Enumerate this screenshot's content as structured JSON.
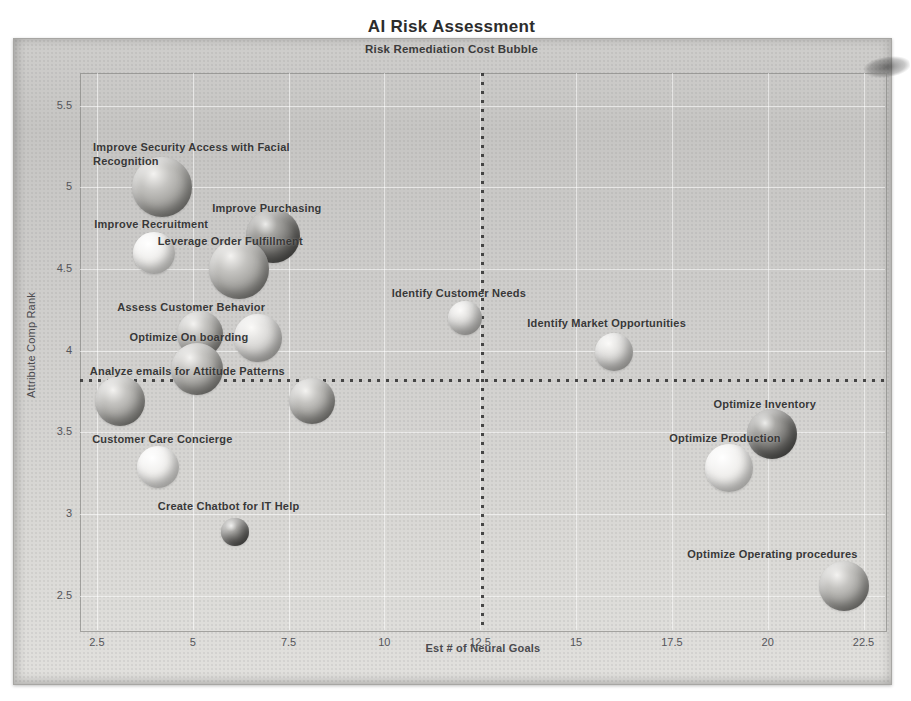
{
  "header": {
    "title": "AI Risk Assessment",
    "subtitle": "Risk Remediation Cost Bubble"
  },
  "chart_data": {
    "type": "scatter",
    "variant": "bubble",
    "title": "AI Risk Assessment",
    "subtitle": "Risk Remediation Cost Bubble",
    "xlabel": "Est # of Neural Goals",
    "ylabel": "Attribute Comp Rank",
    "xlim": [
      2.06,
      23.06
    ],
    "ylim": [
      2.29,
      5.7
    ],
    "x_ticks": [
      2.5,
      5,
      7.5,
      10,
      12.5,
      15,
      17.5,
      20,
      22.5
    ],
    "y_ticks": [
      5.5,
      5,
      4.5,
      4,
      3.5,
      3,
      2.5
    ],
    "grid": true,
    "legend": false,
    "reference_lines": {
      "vertical_x": 12.55,
      "horizontal_y": 3.82
    },
    "points": [
      {
        "label": "Improve Security Access with Facial Recognition",
        "x": 4.2,
        "y": 5.0,
        "r": 30,
        "shade": "medium",
        "label_dx": -69,
        "label_dy": -47,
        "label_width": 220
      },
      {
        "label": "Improve Recruitment",
        "x": 4.0,
        "y": 4.6,
        "r": 21,
        "shade": "xlight",
        "label_dx": -60,
        "label_dy": -35
      },
      {
        "label": "Improve Purchasing",
        "x": 7.1,
        "y": 4.7,
        "r": 27,
        "shade": "dark",
        "label_dx": -61,
        "label_dy": -34
      },
      {
        "label": "Leverage Order Fulfillment",
        "x": 6.2,
        "y": 4.5,
        "r": 30,
        "shade": "medium",
        "label_dx": -81,
        "label_dy": -34
      },
      {
        "label": "Assess Customer Behavior",
        "x": 5.2,
        "y": 4.1,
        "r": 23,
        "shade": "medium",
        "label_dx": -83,
        "label_dy": -33
      },
      {
        "label": "",
        "x": 6.7,
        "y": 4.08,
        "r": 24,
        "shade": "light"
      },
      {
        "label": "Optimize On boarding",
        "x": 5.1,
        "y": 3.89,
        "r": 26,
        "shade": "medium",
        "label_dx": -67,
        "label_dy": -38
      },
      {
        "label": "Analyze emails for Attitude Patterns",
        "x": 3.1,
        "y": 3.69,
        "r": 25,
        "shade": "medium",
        "label_dx": -30,
        "label_dy": -36
      },
      {
        "label": "",
        "x": 8.1,
        "y": 3.69,
        "r": 23,
        "shade": "medium"
      },
      {
        "label": "Identify Customer Needs",
        "x": 12.1,
        "y": 4.2,
        "r": 17,
        "shade": "light",
        "label_dx": -73,
        "label_dy": -31
      },
      {
        "label": "Identify Market Opportunities",
        "x": 16.0,
        "y": 3.99,
        "r": 19,
        "shade": "light",
        "label_dx": -87,
        "label_dy": -35
      },
      {
        "label": "Customer Care Concierge",
        "x": 4.1,
        "y": 3.29,
        "r": 21,
        "shade": "xlight",
        "label_dx": -66,
        "label_dy": -34
      },
      {
        "label": "Create Chatbot for IT Help",
        "x": 6.1,
        "y": 2.89,
        "r": 14,
        "shade": "dark",
        "label_dx": -77,
        "label_dy": -32
      },
      {
        "label": "Optimize Inventory",
        "x": 20.1,
        "y": 3.49,
        "r": 25,
        "shade": "dark",
        "label_dx": -58,
        "label_dy": -36
      },
      {
        "label": "Optimize Production",
        "x": 19.0,
        "y": 3.28,
        "r": 24,
        "shade": "xlight",
        "label_dx": -60,
        "label_dy": -36
      },
      {
        "label": "Optimize Operating procedures",
        "x": 22.0,
        "y": 2.56,
        "r": 25,
        "shade": "medium",
        "label_dx": -157,
        "label_dy": -38
      }
    ]
  },
  "colors": {
    "card_bg_top": "#c6c5c3",
    "card_bg_bottom": "#e1e0dd",
    "bubble_label_text": "#383838",
    "axis_text": "#55555a",
    "title_text": "#2c2c2c",
    "dotted_line": "#2d2d2d",
    "grid_line": "rgba(255,255,255,0.55)"
  }
}
